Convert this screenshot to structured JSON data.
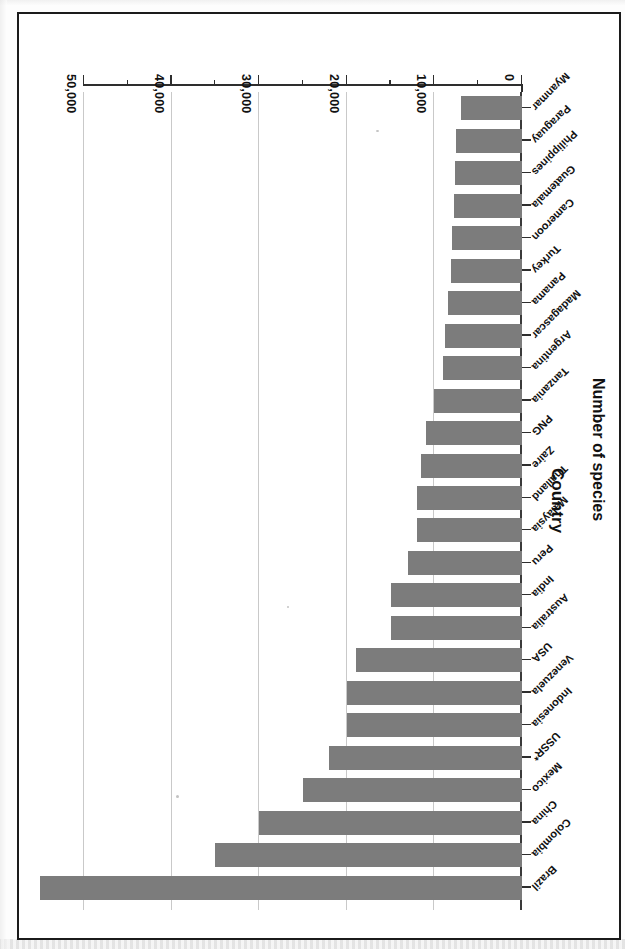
{
  "figure": {
    "frame_color": "#1b1b1b",
    "background": "#ffffff",
    "bar_color": "#7c7c7c",
    "orientation_note": "scanned-upside-down"
  },
  "chart_data": {
    "type": "bar",
    "title": "",
    "xlabel": "Country",
    "ylabel": "Number of species",
    "orientation": "horizontal",
    "grid": true,
    "legend": "none",
    "ylim": [
      0,
      55000
    ],
    "tick_labels": [
      "0",
      "10,000",
      "20,000",
      "30,000",
      "40,000",
      "50,000"
    ],
    "tick_values": [
      0,
      10000,
      20000,
      30000,
      40000,
      50000
    ],
    "minor_tick_values": [
      5000,
      15000,
      25000,
      35000,
      45000
    ],
    "categories": [
      "Brazil",
      "Colombia",
      "China",
      "Mexico",
      "USSR*",
      "Indonesia",
      "Venezuela",
      "USA",
      "Australia",
      "India",
      "Peru",
      "Malaysia",
      "Thailand",
      "Zaire",
      "PNG",
      "Tanzania",
      "Argentina",
      "Madagascar",
      "Panama",
      "Turkey",
      "Cameroon",
      "Guatemala",
      "Philippines",
      "Paraguay",
      "Myanmar"
    ],
    "values": [
      55000,
      35000,
      30000,
      25000,
      22000,
      20000,
      20000,
      19000,
      15000,
      15000,
      13000,
      12000,
      12000,
      11500,
      11000,
      10000,
      9000,
      8800,
      8500,
      8100,
      8000,
      7800,
      7600,
      7500,
      7000
    ]
  }
}
